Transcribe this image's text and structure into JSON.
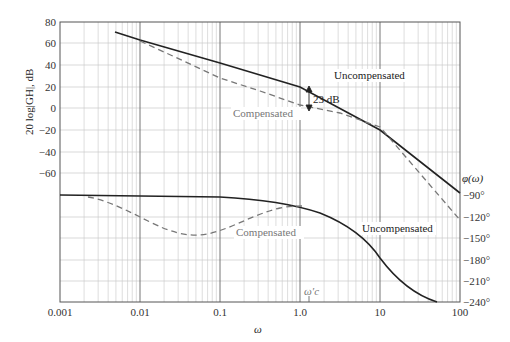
{
  "chart_data": {
    "type": "line",
    "title": "",
    "xlabel": "ω",
    "xscale": "log",
    "x_ticks": [
      "0.001",
      "0.01",
      "0.1",
      "1.0",
      "10",
      "100"
    ],
    "xlim": [
      0.001,
      100
    ],
    "grid": true,
    "magnitude": {
      "ylabel": "20 log|GH|, dB",
      "y_ticks": [
        "80",
        "60",
        "40",
        "20",
        "0",
        "−20",
        "−40",
        "−60"
      ],
      "ylim": [
        -60,
        80
      ],
      "series": [
        {
          "name": "Uncompensated",
          "style": "solid",
          "x": [
            0.005,
            0.01,
            0.1,
            1.0,
            10,
            100
          ],
          "y": [
            71,
            65,
            45,
            25,
            5,
            -55
          ]
        },
        {
          "name": "Compensated",
          "style": "dashed",
          "x": [
            0.01,
            0.1,
            1.0,
            10,
            100
          ],
          "y": [
            65,
            25,
            2,
            -18,
            -80
          ]
        }
      ],
      "annotation": {
        "text": "23 dB",
        "x": 1.5,
        "between": [
          "Uncompensated",
          "Compensated"
        ]
      }
    },
    "phase": {
      "ylabel": "φ(ω)",
      "y_ticks": [
        "−90°",
        "−120°",
        "−150°",
        "−180°",
        "−210°",
        "−240°"
      ],
      "ylim": [
        -240,
        -90
      ],
      "series": [
        {
          "name": "Uncompensated",
          "style": "solid",
          "x": [
            0.001,
            0.1,
            1.0,
            3,
            10,
            50
          ],
          "y": [
            -90,
            -92,
            -100,
            -125,
            -180,
            -240
          ]
        },
        {
          "name": "Compensated",
          "style": "dashed",
          "x": [
            0.0025,
            0.01,
            0.05,
            0.3,
            1.0
          ],
          "y": [
            -92,
            -115,
            -142,
            -112,
            -100
          ]
        }
      ],
      "annotation": {
        "text": "ω′c",
        "x": 1.3
      }
    }
  },
  "labels": {
    "ylabel_mag": "20 log|GH|, dB",
    "ylabel_phase": "φ(ω)",
    "xlabel": "ω",
    "uncomp_mag": "Uncompensated",
    "comp_mag": "Compensated",
    "uncomp_phase": "Uncompensated",
    "comp_phase": "Compensated",
    "gap": "23 dB",
    "wc": "ω′c",
    "x0": "0.001",
    "x1": "0.01",
    "x2": "0.1",
    "x3": "1.0",
    "x4": "10",
    "x5": "100",
    "m80": "80",
    "m60": "60",
    "m40": "40",
    "m20": "20",
    "m0": "0",
    "mn20": "−20",
    "mn40": "−40",
    "mn60": "−60",
    "p90": "−90°",
    "p120": "−120°",
    "p150": "−150°",
    "p180": "−180°",
    "p210": "−210°",
    "p240": "−240°"
  }
}
